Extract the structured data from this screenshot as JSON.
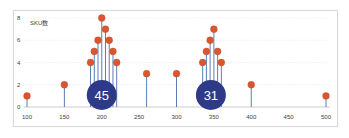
{
  "chart_data": {
    "type": "scatter",
    "subtype": "lollipop",
    "title": "",
    "ylabel": "SKU数",
    "xlabel": "",
    "xlim": [
      100,
      500
    ],
    "ylim": [
      0,
      8
    ],
    "x_ticks": [
      100,
      150,
      200,
      250,
      300,
      350,
      400,
      450,
      500
    ],
    "y_ticks": [
      0,
      2,
      4,
      6,
      8
    ],
    "grid": "horizontal",
    "legend": "none",
    "series": [
      {
        "name": "SKU数",
        "color": "#d9572e",
        "stem_color": "#5b7fb5",
        "points": [
          {
            "x": 100,
            "y": 1
          },
          {
            "x": 150,
            "y": 2
          },
          {
            "x": 185,
            "y": 4
          },
          {
            "x": 190,
            "y": 5
          },
          {
            "x": 195,
            "y": 6
          },
          {
            "x": 200,
            "y": 8
          },
          {
            "x": 205,
            "y": 7
          },
          {
            "x": 210,
            "y": 6
          },
          {
            "x": 215,
            "y": 5
          },
          {
            "x": 220,
            "y": 4
          },
          {
            "x": 260,
            "y": 3
          },
          {
            "x": 300,
            "y": 3
          },
          {
            "x": 335,
            "y": 4
          },
          {
            "x": 340,
            "y": 5
          },
          {
            "x": 345,
            "y": 6
          },
          {
            "x": 350,
            "y": 7
          },
          {
            "x": 355,
            "y": 5
          },
          {
            "x": 360,
            "y": 4
          },
          {
            "x": 400,
            "y": 2
          },
          {
            "x": 500,
            "y": 1
          }
        ]
      }
    ],
    "annotations": [
      {
        "label": "45",
        "x": 200,
        "y": 1,
        "color": "#2e3a87"
      },
      {
        "label": "31",
        "x": 346,
        "y": 1,
        "color": "#2e3a87"
      }
    ]
  },
  "labels": {
    "y_axis_title": "SKU数",
    "bubble_left": "45",
    "bubble_right": "31",
    "x_ticks": [
      "100",
      "150",
      "200",
      "250",
      "300",
      "350",
      "400",
      "450",
      "500"
    ],
    "y_ticks": [
      "0",
      "2",
      "4",
      "6",
      "8"
    ]
  }
}
